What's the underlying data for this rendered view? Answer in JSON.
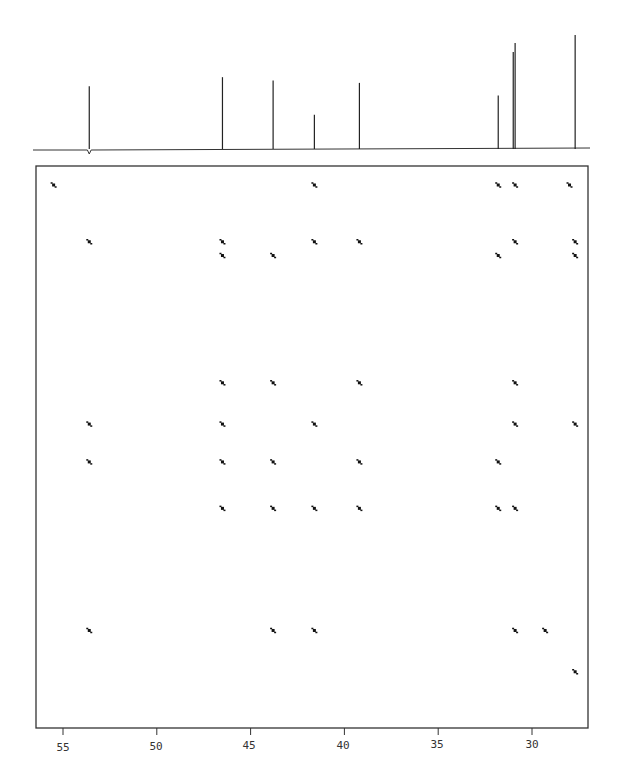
{
  "chart_data": {
    "type": "scatter",
    "title": "",
    "xlabel": "ppm",
    "ylabel": "",
    "xlim": [
      58.5,
      26.5
    ],
    "x_ticks": [
      55,
      50,
      45,
      40,
      35,
      30
    ],
    "x_tick_labels": [
      "55",
      "50",
      "45",
      "40",
      "35",
      "30"
    ],
    "grid": false,
    "legend": null,
    "projection_1d": {
      "peaks_ppm": [
        53.6,
        46.5,
        43.8,
        41.6,
        39.2,
        31.8,
        31.0,
        30.9,
        27.7
      ],
      "relative_heights": [
        0.55,
        0.63,
        0.6,
        0.3,
        0.58,
        0.47,
        0.85,
        0.93,
        1.0
      ]
    },
    "cross_peaks": [
      {
        "x": 55.5,
        "y": 27.7
      },
      {
        "x": 41.6,
        "y": 27.7
      },
      {
        "x": 31.8,
        "y": 27.7
      },
      {
        "x": 30.9,
        "y": 27.7
      },
      {
        "x": 28.0,
        "y": 27.7
      },
      {
        "x": 53.6,
        "y": 31.0
      },
      {
        "x": 46.5,
        "y": 31.0
      },
      {
        "x": 41.6,
        "y": 31.0
      },
      {
        "x": 39.2,
        "y": 31.0
      },
      {
        "x": 30.9,
        "y": 31.0
      },
      {
        "x": 27.7,
        "y": 31.0
      },
      {
        "x": 46.5,
        "y": 31.8
      },
      {
        "x": 43.8,
        "y": 31.8
      },
      {
        "x": 31.8,
        "y": 31.8
      },
      {
        "x": 27.7,
        "y": 31.8
      },
      {
        "x": 46.5,
        "y": 39.2
      },
      {
        "x": 43.8,
        "y": 39.2
      },
      {
        "x": 39.2,
        "y": 39.2
      },
      {
        "x": 30.9,
        "y": 39.2
      },
      {
        "x": 53.6,
        "y": 41.6
      },
      {
        "x": 46.5,
        "y": 41.6
      },
      {
        "x": 41.6,
        "y": 41.6
      },
      {
        "x": 30.9,
        "y": 41.6
      },
      {
        "x": 27.7,
        "y": 41.6
      },
      {
        "x": 53.6,
        "y": 43.8
      },
      {
        "x": 46.5,
        "y": 43.8
      },
      {
        "x": 43.8,
        "y": 43.8
      },
      {
        "x": 39.2,
        "y": 43.8
      },
      {
        "x": 31.8,
        "y": 43.8
      },
      {
        "x": 46.5,
        "y": 46.5
      },
      {
        "x": 43.8,
        "y": 46.5
      },
      {
        "x": 41.6,
        "y": 46.5
      },
      {
        "x": 39.2,
        "y": 46.5
      },
      {
        "x": 31.8,
        "y": 46.5
      },
      {
        "x": 30.9,
        "y": 46.5
      },
      {
        "x": 53.6,
        "y": 53.6
      },
      {
        "x": 43.8,
        "y": 53.6
      },
      {
        "x": 41.6,
        "y": 53.6
      },
      {
        "x": 30.9,
        "y": 53.6
      },
      {
        "x": 29.3,
        "y": 53.6
      },
      {
        "x": 27.7,
        "y": 56.0
      }
    ]
  },
  "axis": {
    "labels": [
      "55",
      "50",
      "45",
      "40",
      "35",
      "30"
    ]
  }
}
